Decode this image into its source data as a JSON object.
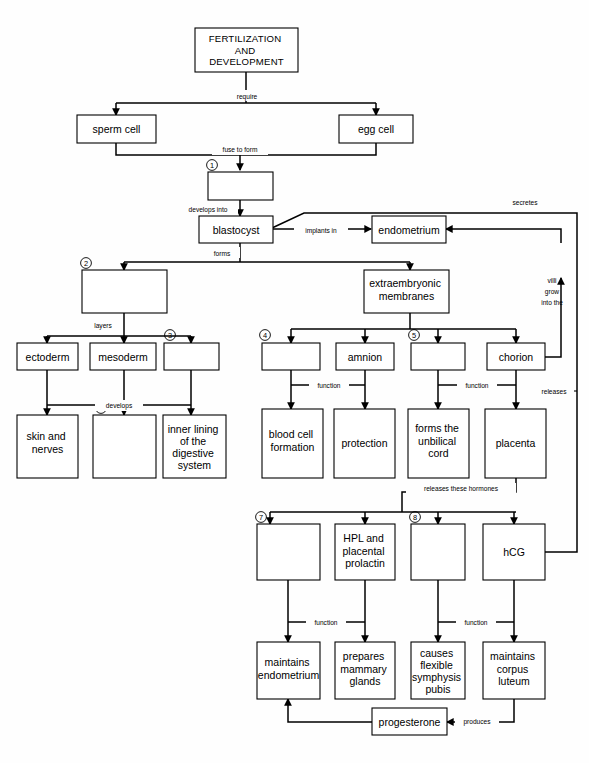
{
  "diagram": {
    "title": "FERTILIZATION AND DEVELOPMENT",
    "type": "flowchart",
    "colors": {
      "stroke": "#000000",
      "fill": "#ffffff",
      "background": "#fefefe"
    }
  },
  "nodes": [
    {
      "id": "title",
      "label": "FERTILIZATION\nAND\nDEVELOPMENT",
      "number": "",
      "blank": false
    },
    {
      "id": "sperm",
      "label": "sperm cell",
      "number": "",
      "blank": false
    },
    {
      "id": "egg",
      "label": "egg cell",
      "number": "",
      "blank": false
    },
    {
      "id": "zygote",
      "label": "",
      "number": "1",
      "blank": true
    },
    {
      "id": "blastocyst",
      "label": "blastocyst",
      "number": "",
      "blank": false
    },
    {
      "id": "endometrium",
      "label": "endometrium",
      "number": "",
      "blank": false
    },
    {
      "id": "germlayers",
      "label": "",
      "number": "2",
      "blank": true
    },
    {
      "id": "exmembranes",
      "label": "extraembryonic\nmembranes",
      "number": "",
      "blank": false
    },
    {
      "id": "ectoderm",
      "label": "ectoderm",
      "number": "",
      "blank": false
    },
    {
      "id": "mesoderm",
      "label": "mesoderm",
      "number": "",
      "blank": false
    },
    {
      "id": "endoderm",
      "label": "",
      "number": "3",
      "blank": true
    },
    {
      "id": "yolksac",
      "label": "",
      "number": "4",
      "blank": true
    },
    {
      "id": "amnion",
      "label": "amnion",
      "number": "",
      "blank": false
    },
    {
      "id": "allantois",
      "label": "",
      "number": "5",
      "blank": true
    },
    {
      "id": "chorion",
      "label": "chorion",
      "number": "",
      "blank": false
    },
    {
      "id": "skin",
      "label": "skin and\nnerves",
      "number": "",
      "blank": false
    },
    {
      "id": "muscles",
      "label": "",
      "number": "6",
      "blank": true
    },
    {
      "id": "innerlining",
      "label": "inner lining\nof the\ndigestive\nsystem",
      "number": "",
      "blank": false
    },
    {
      "id": "bloodcell",
      "label": "blood cell\nformation",
      "number": "",
      "blank": false
    },
    {
      "id": "protection",
      "label": "protection",
      "number": "",
      "blank": false
    },
    {
      "id": "umbilical",
      "label": "forms the\nunbilical\ncord",
      "number": "",
      "blank": false
    },
    {
      "id": "placenta",
      "label": "placenta",
      "number": "",
      "blank": false
    },
    {
      "id": "estrogen",
      "label": "",
      "number": "7",
      "blank": true
    },
    {
      "id": "hpl",
      "label": "HPL and\nplacental\nprolactin",
      "number": "",
      "blank": false
    },
    {
      "id": "relaxin",
      "label": "",
      "number": "8",
      "blank": true
    },
    {
      "id": "hcg",
      "label": "hCG",
      "number": "",
      "blank": false
    },
    {
      "id": "maintainsendo",
      "label": "maintains\nendometrium",
      "number": "",
      "blank": false
    },
    {
      "id": "mammary",
      "label": "prepares\nmammary\nglands",
      "number": "",
      "blank": false
    },
    {
      "id": "symphysis",
      "label": "causes\nflexible\nsymphysis\npubis",
      "number": "",
      "blank": false
    },
    {
      "id": "corpusluteum",
      "label": "maintains\ncorpus\nluteum",
      "number": "",
      "blank": false
    },
    {
      "id": "progesterone",
      "label": "progesterone",
      "number": "",
      "blank": false
    }
  ],
  "edges": [
    {
      "from": "title",
      "to": "sperm,egg",
      "label": "require"
    },
    {
      "from": "sperm,egg",
      "to": "zygote",
      "label": "fuse to form"
    },
    {
      "from": "zygote",
      "to": "blastocyst",
      "label": "develops into"
    },
    {
      "from": "blastocyst",
      "to": "endometrium",
      "label": "implants in"
    },
    {
      "from": "blastocyst",
      "to": "germlayers,exmembranes",
      "label": "forms"
    },
    {
      "from": "germlayers",
      "to": "ectoderm,mesoderm,endoderm",
      "label": "layers"
    },
    {
      "from": "ectoderm,mesoderm,endoderm",
      "to": "skin,muscles,innerlining",
      "label": "develops"
    },
    {
      "from": "yolksac,amnion",
      "to": "bloodcell,protection",
      "label": "function"
    },
    {
      "from": "allantois,chorion",
      "to": "umbilical,placenta",
      "label": "function"
    },
    {
      "from": "chorion",
      "to": "endometrium",
      "label": "villi grow into the"
    },
    {
      "from": "placenta",
      "to": "hormones",
      "label": "releases these hormones"
    },
    {
      "from": "estrogen,hpl",
      "to": "maintainsendo,mammary",
      "label": "function"
    },
    {
      "from": "relaxin,hcg",
      "to": "symphysis,corpusluteum",
      "label": "function"
    },
    {
      "from": "hcg",
      "to": "endometrium",
      "label": "secretes"
    },
    {
      "from": "hcg",
      "to": "hcg",
      "label": "releases"
    },
    {
      "from": "corpusluteum",
      "to": "progesterone",
      "label": "produces"
    },
    {
      "from": "progesterone",
      "to": "maintainsendo",
      "label": ""
    }
  ],
  "labels": {
    "require": "require",
    "fuse_to_form": "fuse to form",
    "develops_into": "develops into",
    "implants_in": "implants in",
    "forms": "forms",
    "layers": "layers",
    "develops": "develops",
    "function1": "function",
    "function2": "function",
    "function3": "function",
    "function4": "function",
    "secretes": "secretes",
    "releases": "releases",
    "releases_these_hormones": "releases these hormones",
    "produces": "produces",
    "villi1": "villi",
    "villi2": "grow",
    "villi3": "into the"
  },
  "numbers": {
    "n1": "1",
    "n2": "2",
    "n3": "3",
    "n4": "4",
    "n5": "5",
    "n6": "6",
    "n7": "7",
    "n8": "8"
  }
}
